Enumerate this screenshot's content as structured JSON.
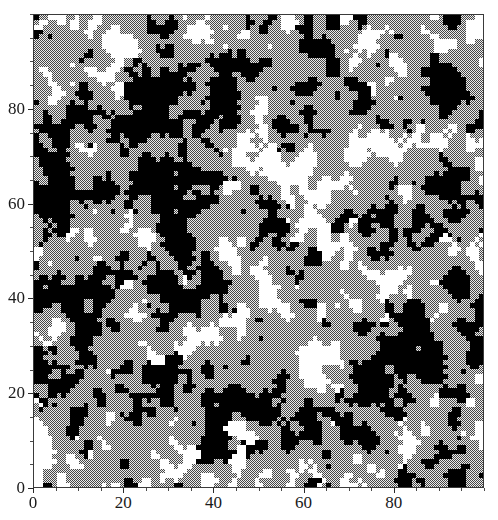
{
  "figure": {
    "background_color": "#ffffff",
    "width": 498,
    "height": 520
  },
  "plot": {
    "frame_color": "#3a3a3a",
    "left": 33,
    "top": 14,
    "width": 451,
    "height": 474
  },
  "axes": {
    "x": {
      "tick_labels": [
        "0",
        "20",
        "40",
        "60",
        "80"
      ],
      "tick_values": [
        0,
        20,
        40,
        60,
        80
      ],
      "minor_tick_step": 5,
      "range": [
        0,
        100
      ],
      "label": ""
    },
    "y": {
      "tick_labels": [
        "0",
        "20",
        "40",
        "60",
        "80"
      ],
      "tick_values": [
        0,
        20,
        40,
        60,
        80
      ],
      "minor_tick_step": 5,
      "range": [
        0,
        100
      ],
      "label": ""
    }
  },
  "chart_data": {
    "type": "heatmap",
    "title": "",
    "subtitle": "",
    "xlabel": "",
    "ylabel": "",
    "xlim": [
      0,
      100
    ],
    "ylim": [
      0,
      100
    ],
    "grid": false,
    "legend": "none",
    "grid_size": [
      100,
      100
    ],
    "cell_width": 4.49,
    "cell_height": 4.72,
    "states": [
      {
        "name": "black",
        "value": 0,
        "color": "#000000",
        "fill": "solid",
        "share": 0.3
      },
      {
        "name": "white",
        "value": 1,
        "color": "#ffffff",
        "fill": "solid",
        "share": 0.37
      },
      {
        "name": "gray",
        "value": 2,
        "color": "#9a9a9a",
        "fill": "checkerboard-dither",
        "share": 0.33
      }
    ],
    "generation": {
      "seed": 20240517,
      "noise": "spatially-correlated-three-state",
      "smoothing_passes": 2,
      "cluster_scale": 5.5
    }
  }
}
